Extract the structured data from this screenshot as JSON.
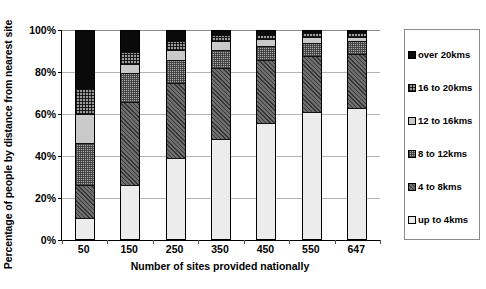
{
  "chart_data": {
    "type": "bar",
    "stacked": true,
    "stack_mode": "percent",
    "title": "",
    "xlabel": "Number of sites provided nationally",
    "ylabel": "Percentage of people by distance from nearest site",
    "categories": [
      "50",
      "150",
      "250",
      "350",
      "450",
      "550",
      "647"
    ],
    "ylim": [
      0,
      100
    ],
    "ytick_labels": [
      "0%",
      "20%",
      "40%",
      "60%",
      "80%",
      "100%"
    ],
    "ytick_values": [
      0,
      20,
      40,
      60,
      80,
      100
    ],
    "grid": true,
    "grid_axis": "y",
    "legend_position": "right",
    "series": [
      {
        "name": "up to 4kms",
        "pattern": "solid-very-light-grey",
        "color": "#ececec",
        "values": [
          10,
          26,
          39,
          48,
          56,
          61,
          63
        ]
      },
      {
        "name": "4 to 8kms",
        "pattern": "dark-grey-diagonal-hatch",
        "color": "#6f6f6f",
        "values": [
          16,
          40,
          36,
          34,
          30,
          27,
          26
        ]
      },
      {
        "name": "8 to 12kms",
        "pattern": "mid-grey-fine-checker",
        "color": "#a7a7a7",
        "values": [
          20,
          14,
          11,
          9,
          7,
          6,
          6
        ]
      },
      {
        "name": "12 to 16kms",
        "pattern": "solid-light-grey",
        "color": "#c9c9c9",
        "values": [
          14,
          4,
          5,
          4,
          3,
          3,
          2
        ]
      },
      {
        "name": "16 to 20kms",
        "pattern": "grey-cross-hatch-grid",
        "color": "#9a9a9a",
        "values": [
          12,
          6,
          4,
          3,
          2,
          2,
          2
        ]
      },
      {
        "name": "over 20kms",
        "pattern": "solid-black",
        "color": "#0a0a0a",
        "values": [
          28,
          10,
          5,
          2,
          2,
          1,
          1
        ]
      }
    ]
  },
  "legend": {
    "items": [
      {
        "label": "over 20kms",
        "series_index": 5
      },
      {
        "label": "16 to 20kms",
        "series_index": 4
      },
      {
        "label": "12 to 16kms",
        "series_index": 3
      },
      {
        "label": "8 to 12kms",
        "series_index": 2
      },
      {
        "label": "4 to 8kms",
        "series_index": 1
      },
      {
        "label": "up to 4kms",
        "series_index": 0
      }
    ]
  }
}
